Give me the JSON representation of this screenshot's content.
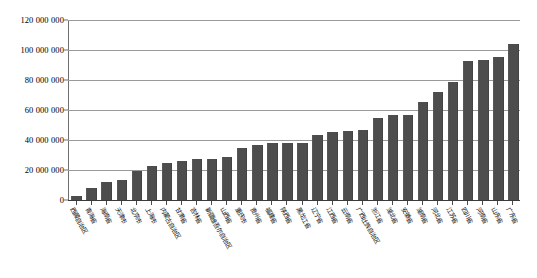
{
  "chart_data": {
    "type": "bar",
    "title": "",
    "subtitle": "",
    "xlabel": "",
    "ylabel": "",
    "ylim": [
      0,
      120000000
    ],
    "ytick_step": 20000000,
    "ytick_labels": [
      "120 000 000",
      "100 000 000",
      "80 000 000",
      "60 000 000",
      "40 000 000",
      "20 000 000",
      "0"
    ],
    "ytick_values": [
      120000000,
      100000000,
      80000000,
      60000000,
      40000000,
      20000000,
      0
    ],
    "grid": true,
    "legend": false,
    "legend_position": "none",
    "bar_color": "#4d4d4d",
    "gridline_color": "#9a9a9a",
    "axis_color": "#6e6e6e",
    "categories": [
      "西藏自治区",
      "青海省",
      "海南省",
      "天津市",
      "北京市",
      "上海市",
      "内蒙古自治区",
      "甘肃省",
      "吉林省",
      "新疆维吾尔自治区",
      "山西省",
      "重庆市",
      "贵州省",
      "福建省",
      "陕西省",
      "黑龙江省",
      "辽宁省",
      "江西省",
      "云南省",
      "广西壮族自治区",
      "浙江省",
      "湖北省",
      "安徽省",
      "湖南省",
      "河北省",
      "江苏省",
      "四川省",
      "河南省",
      "山东省",
      "广东省"
    ],
    "values": [
      3000000,
      8000000,
      12000000,
      13500000,
      19500000,
      23000000,
      25000000,
      25800000,
      27500000,
      27500000,
      29000000,
      34500000,
      36800000,
      38000000,
      38000000,
      38000000,
      43500000,
      45500000,
      45800000,
      46500000,
      54500000,
      57000000,
      56800000,
      65500000,
      72000000,
      78800000,
      93000000,
      93500000,
      95500000,
      104000000
    ]
  }
}
